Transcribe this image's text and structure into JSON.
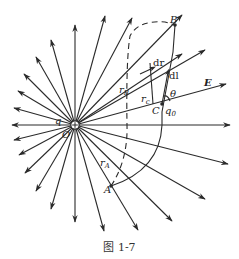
{
  "figure": {
    "caption": "图 1-7",
    "charge_label": "q",
    "origin_label": "O",
    "points": {
      "A": "A",
      "B": "B",
      "C": "C"
    },
    "labels": {
      "r_A": "r",
      "r_A_sub": "A",
      "r_B": "r",
      "r_B_sub": "B",
      "r_c": "r",
      "r_c_sub": "c",
      "dr": "dr",
      "dl": "dl",
      "theta": "θ",
      "E": "E",
      "q0": "q",
      "q0_sub": "0"
    },
    "colors": {
      "line": "#2a2a2a",
      "background": "#ffffff"
    }
  }
}
